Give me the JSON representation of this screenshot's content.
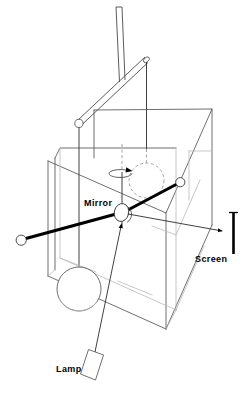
{
  "figure": {
    "background_color": "#ffffff",
    "line_color": "#3a3a3a",
    "accent_color": "#000000"
  },
  "labels": {
    "mirror": "Mirror",
    "screen": "Screen",
    "lamp": "Lamp"
  },
  "components": {
    "support_rod": "support-rod",
    "suspension_arm": "suspension-arm",
    "torsion_wire": "torsion-wire",
    "enclosure_box": "enclosure-box",
    "dumbbell_bar": "dumbbell-bar",
    "large_sphere": "large-sphere",
    "small_sphere_left": "small-sphere-left",
    "small_sphere_right": "small-sphere-right",
    "ghost_sphere": "ghost-sphere",
    "rotation_arrow": "rotation-arrow",
    "mirror_disc": "mirror-disc",
    "incident_ray": "incident-ray",
    "reflected_ray": "reflected-ray",
    "lamp_body": "lamp-body",
    "screen_bar": "screen-bar"
  }
}
